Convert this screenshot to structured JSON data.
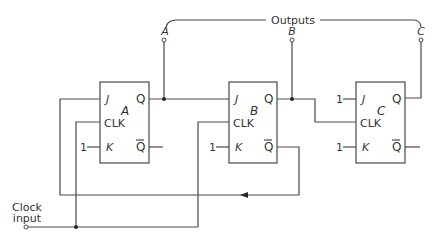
{
  "diagram": {
    "type": "3-bit JK flip-flop counter circuit",
    "brace_label": "Outputs",
    "outputs": [
      {
        "label": "A"
      },
      {
        "label": "B"
      },
      {
        "label": "C"
      }
    ],
    "flip_flops": [
      {
        "name": "A",
        "pins": {
          "j": "J",
          "clk": "CLK",
          "k": "K",
          "q": "Q",
          "qbar": "Q"
        },
        "k_input": "1"
      },
      {
        "name": "B",
        "pins": {
          "j": "J",
          "clk": "CLK",
          "k": "K",
          "q": "Q",
          "qbar": "Q"
        },
        "k_input": "1"
      },
      {
        "name": "C",
        "pins": {
          "j": "J",
          "clk": "CLK",
          "k": "K",
          "q": "Q",
          "qbar": "Q"
        },
        "j_input": "1",
        "k_input": "1"
      }
    ],
    "clock": {
      "line1": "Clock",
      "line2": "input"
    },
    "colors": {
      "line": "#4a4a4a",
      "text": "#333333",
      "background": "#ffffff"
    }
  }
}
